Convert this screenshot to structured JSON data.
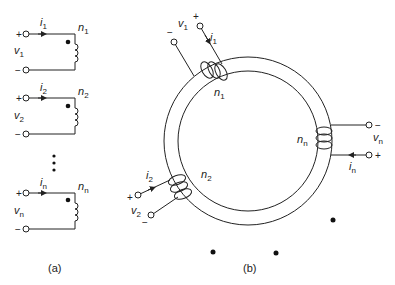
{
  "figure_a": {
    "caption": "(a)",
    "windings": [
      {
        "current": "i",
        "current_sub": "1",
        "turns": "n",
        "turns_sub": "1",
        "voltage": "v",
        "voltage_sub": "1",
        "plus": "+",
        "minus": "−"
      },
      {
        "current": "i",
        "current_sub": "2",
        "turns": "n",
        "turns_sub": "2",
        "voltage": "v",
        "voltage_sub": "2",
        "plus": "+",
        "minus": "−"
      },
      {
        "current": "i",
        "current_sub": "n",
        "turns": "n",
        "turns_sub": "n",
        "voltage": "v",
        "voltage_sub": "n",
        "plus": "+",
        "minus": "−"
      }
    ],
    "ellipsis": "⋮"
  },
  "figure_b": {
    "caption": "(b)",
    "winding_1": {
      "current": "i",
      "current_sub": "1",
      "turns": "n",
      "turns_sub": "1",
      "voltage": "v",
      "voltage_sub": "1",
      "plus": "+",
      "minus": "−"
    },
    "winding_2": {
      "current": "i",
      "current_sub": "2",
      "turns": "n",
      "turns_sub": "2",
      "voltage": "v",
      "voltage_sub": "2",
      "plus": "+",
      "minus": "−"
    },
    "winding_n": {
      "current": "i",
      "current_sub": "n",
      "turns": "n",
      "turns_sub": "n",
      "voltage": "v",
      "voltage_sub": "n",
      "plus": "+",
      "minus": "−"
    }
  }
}
